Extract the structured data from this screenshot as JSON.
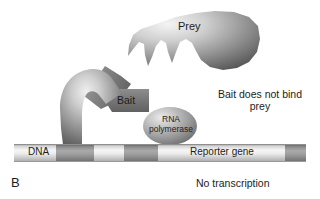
{
  "figure": {
    "panel_letter": "B",
    "type": "diagram"
  },
  "labels": {
    "prey": "Prey",
    "bait": "Bait",
    "rna_polymerase": "RNA polymerase",
    "dna": "DNA",
    "reporter_gene": "Reporter gene",
    "no_bind": "Bait does not bind prey",
    "no_transcription": "No transcription"
  },
  "colors": {
    "background": "#ffffff",
    "text": "#1d1d1d",
    "shape_light": "#e8e8e8",
    "shape_mid": "#9a9a9a",
    "shape_dark": "#4a4a4a",
    "dna_light": "#f2f2f2",
    "dna_mid": "#c9c9c9",
    "dna_segment_dark": "#6e6e6e"
  },
  "elements": {
    "prey_shape": "jagged-teeth-blob",
    "bait_shape": "bent-arm-blob",
    "rnap_shape": "ellipse",
    "dna_shape": "horizontal-bar-with-segments"
  },
  "dna_track": {
    "x_start": 14,
    "x_end": 306,
    "segments": [
      {
        "name": "upstream-site",
        "x": 56,
        "width": 38
      },
      {
        "name": "operator-site",
        "x": 124,
        "width": 34
      },
      {
        "name": "reporter-end",
        "x": 285,
        "width": 21
      }
    ]
  }
}
